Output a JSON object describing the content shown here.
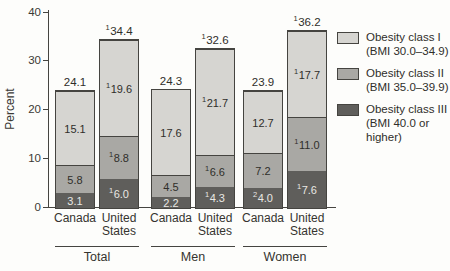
{
  "chart_data": {
    "type": "bar",
    "subtype": "stacked",
    "ylabel": "Percent",
    "ylim": [
      0,
      40
    ],
    "yticks": [
      "0",
      "10",
      "20",
      "30",
      "40"
    ],
    "grid": false,
    "legend_position": "right",
    "series": [
      {
        "name": "Obesity class I",
        "bmi": "(BMI 30.0–34.9)",
        "color": "#d6d5d1",
        "label_color": "#2f2e2a"
      },
      {
        "name": "Obesity class II",
        "bmi": "(BMI 35.0–39.9)",
        "color": "#a9a8a4",
        "label_color": "#2f2e2a"
      },
      {
        "name": "Obesity class III",
        "bmi": "(BMI 40.0 or higher)",
        "color": "#5f5e5b",
        "label_color": "#e9e8e4"
      }
    ],
    "groups": [
      {
        "label": "Total",
        "bars": [
          {
            "category": "Canada",
            "total": {
              "sup": "",
              "text": "24.1",
              "value": 24.1
            },
            "segments": [
              {
                "series_index": 2,
                "value": 3.1,
                "sup": "",
                "text": "3.1"
              },
              {
                "series_index": 1,
                "value": 5.8,
                "sup": "",
                "text": "5.8"
              },
              {
                "series_index": 0,
                "value": 15.1,
                "sup": "",
                "text": "15.1"
              }
            ]
          },
          {
            "category": "United States",
            "total": {
              "sup": "1",
              "text": "34.4",
              "value": 34.4
            },
            "segments": [
              {
                "series_index": 2,
                "value": 6.0,
                "sup": "1",
                "text": "6.0"
              },
              {
                "series_index": 1,
                "value": 8.8,
                "sup": "1",
                "text": "8.8"
              },
              {
                "series_index": 0,
                "value": 19.6,
                "sup": "1",
                "text": "19.6"
              }
            ]
          }
        ]
      },
      {
        "label": "Men",
        "bars": [
          {
            "category": "Canada",
            "total": {
              "sup": "",
              "text": "24.3",
              "value": 24.3
            },
            "segments": [
              {
                "series_index": 2,
                "value": 2.2,
                "sup": "",
                "text": "2.2"
              },
              {
                "series_index": 1,
                "value": 4.5,
                "sup": "",
                "text": "4.5"
              },
              {
                "series_index": 0,
                "value": 17.6,
                "sup": "",
                "text": "17.6"
              }
            ]
          },
          {
            "category": "United States",
            "total": {
              "sup": "1",
              "text": "32.6",
              "value": 32.6
            },
            "segments": [
              {
                "series_index": 2,
                "value": 4.3,
                "sup": "1",
                "text": "4.3"
              },
              {
                "series_index": 1,
                "value": 6.6,
                "sup": "1",
                "text": "6.6"
              },
              {
                "series_index": 0,
                "value": 21.7,
                "sup": "1",
                "text": "21.7"
              }
            ]
          }
        ]
      },
      {
        "label": "Women",
        "bars": [
          {
            "category": "Canada",
            "total": {
              "sup": "",
              "text": "23.9",
              "value": 23.9
            },
            "segments": [
              {
                "series_index": 2,
                "value": 4.0,
                "sup": "2",
                "text": "4.0"
              },
              {
                "series_index": 1,
                "value": 7.2,
                "sup": "",
                "text": "7.2"
              },
              {
                "series_index": 0,
                "value": 12.7,
                "sup": "",
                "text": "12.7"
              }
            ]
          },
          {
            "category": "United States",
            "total": {
              "sup": "1",
              "text": "36.2",
              "value": 36.2
            },
            "segments": [
              {
                "series_index": 2,
                "value": 7.6,
                "sup": "1",
                "text": "7.6"
              },
              {
                "series_index": 1,
                "value": 11.0,
                "sup": "1",
                "text": "11.0"
              },
              {
                "series_index": 0,
                "value": 17.7,
                "sup": "1",
                "text": "17.7"
              }
            ]
          }
        ]
      }
    ]
  }
}
